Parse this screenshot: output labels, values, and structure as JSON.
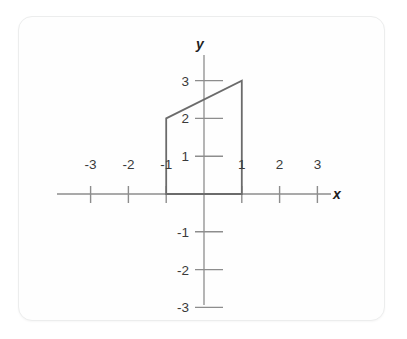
{
  "figure": {
    "title": "",
    "background_color": "#ffffff",
    "card_color": "#fefefe",
    "card_border_color": "#eceded",
    "axis_color": "#8d8d8d",
    "shape_color": "#6b6b6b",
    "label_color": "#3a3a3a"
  },
  "axes": {
    "x_name": "x",
    "y_name": "y",
    "x_ticks": [
      {
        "value": -3,
        "label": "-3"
      },
      {
        "value": -2,
        "label": "-2"
      },
      {
        "value": -1,
        "label": "-1"
      },
      {
        "value": 1,
        "label": "1"
      },
      {
        "value": 2,
        "label": "2"
      },
      {
        "value": 3,
        "label": "3"
      }
    ],
    "y_ticks": [
      {
        "value": 3,
        "label": "3"
      },
      {
        "value": 2,
        "label": "2"
      },
      {
        "value": 1,
        "label": "1"
      },
      {
        "value": -1,
        "label": "-1"
      },
      {
        "value": -2,
        "label": "-2"
      },
      {
        "value": -3,
        "label": "-3"
      }
    ]
  },
  "chart_data": {
    "type": "scatter",
    "title": "",
    "xlabel": "x",
    "ylabel": "y",
    "xlim": [
      -3.8,
      3.8
    ],
    "ylim": [
      -3.6,
      3.8
    ],
    "grid": false,
    "legend": null,
    "xticks": [
      -3,
      -2,
      -1,
      1,
      2,
      3
    ],
    "yticks": [
      -3,
      -2,
      -1,
      1,
      2,
      3
    ],
    "xticklabels": [
      "-3",
      "-2",
      "-1",
      "1",
      "2",
      "3"
    ],
    "yticklabels": [
      "-3",
      "-2",
      "-1",
      "1",
      "2",
      "3"
    ],
    "annotations": [],
    "series": [
      {
        "name": "quadrilateral-region",
        "kind": "closed-polygon",
        "closed": true,
        "fill": "none",
        "stroke": "#6b6b6b",
        "vertices": [
          {
            "x": -1,
            "y": 0
          },
          {
            "x": -1,
            "y": 2
          },
          {
            "x": 1,
            "y": 3
          },
          {
            "x": 1,
            "y": 0
          }
        ],
        "vertex_labels": [
          "(-1, 0)",
          "(-1, 2)",
          "(1, 3)",
          "(1, 0)"
        ]
      }
    ]
  }
}
